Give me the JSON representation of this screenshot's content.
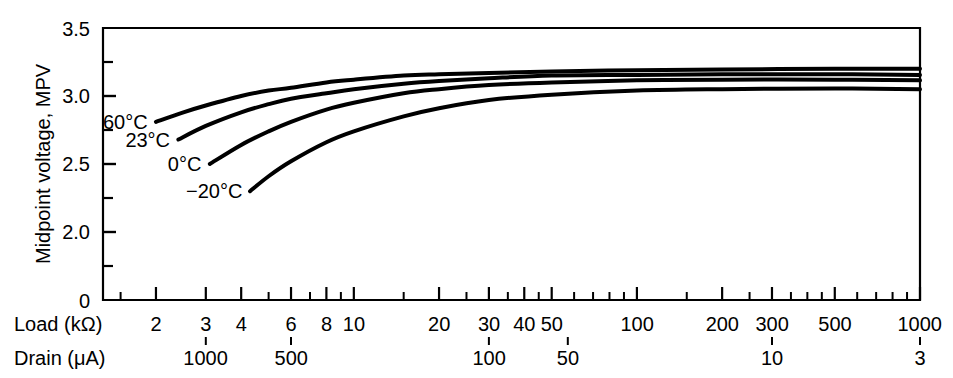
{
  "chart_data": {
    "type": "line",
    "title": "",
    "ylabel": "Midpoint voltage, MPV",
    "xlabel": "Load (kΩ)",
    "xlabel2": "Drain (μA)",
    "xscale": "log",
    "xlim": [
      1.3,
      1000
    ],
    "ylim": [
      1.5,
      3.5
    ],
    "yticks": [
      "3.5",
      "3.0",
      "2.5",
      "2.0",
      "0"
    ],
    "ytick_values": [
      3.5,
      3.0,
      2.5,
      2.0,
      1.5
    ],
    "yminor_ticks": [
      3.25,
      2.75,
      2.25,
      1.75
    ],
    "y_axis_break": true,
    "grid": false,
    "legend_position": "inline-left",
    "xticks": [
      {
        "value": 2,
        "label": "2"
      },
      {
        "value": 3,
        "label": "3"
      },
      {
        "value": 4,
        "label": "4"
      },
      {
        "value": 6,
        "label": "6"
      },
      {
        "value": 8,
        "label": "8"
      },
      {
        "value": 10,
        "label": "10"
      },
      {
        "value": 20,
        "label": "20"
      },
      {
        "value": 30,
        "label": "30"
      },
      {
        "value": 40,
        "label": "40"
      },
      {
        "value": 50,
        "label": "50"
      },
      {
        "value": 100,
        "label": "100"
      },
      {
        "value": 200,
        "label": "200"
      },
      {
        "value": 300,
        "label": "300"
      },
      {
        "value": 500,
        "label": "500"
      },
      {
        "value": 1000,
        "label": "1000"
      }
    ],
    "xminor_ticks": [
      1.5,
      5,
      7,
      9,
      15,
      25,
      35,
      45,
      60,
      70,
      80,
      90,
      150,
      250,
      350,
      400,
      450,
      600,
      700,
      800,
      900
    ],
    "drain_ticks": [
      {
        "load": 3,
        "label": "1000"
      },
      {
        "load": 6,
        "label": "500"
      },
      {
        "load": 30,
        "label": "100"
      },
      {
        "load": 57,
        "label": "50"
      },
      {
        "load": 300,
        "label": "10"
      },
      {
        "load": 1000,
        "label": "3"
      }
    ],
    "series": [
      {
        "name": "60°C",
        "label": "60°C",
        "color": "#000000",
        "points": [
          [
            2.0,
            2.81
          ],
          [
            2.5,
            2.88
          ],
          [
            3.0,
            2.93
          ],
          [
            4.0,
            3.0
          ],
          [
            5.0,
            3.04
          ],
          [
            6.0,
            3.06
          ],
          [
            8.0,
            3.1
          ],
          [
            10,
            3.12
          ],
          [
            15,
            3.15
          ],
          [
            20,
            3.16
          ],
          [
            30,
            3.17
          ],
          [
            50,
            3.18
          ],
          [
            100,
            3.19
          ],
          [
            200,
            3.195
          ],
          [
            500,
            3.2
          ],
          [
            1000,
            3.2
          ]
        ]
      },
      {
        "name": "23°C",
        "label": "23°C",
        "color": "#000000",
        "points": [
          [
            2.4,
            2.68
          ],
          [
            3.0,
            2.78
          ],
          [
            4.0,
            2.88
          ],
          [
            5.0,
            2.94
          ],
          [
            6.0,
            2.98
          ],
          [
            8.0,
            3.02
          ],
          [
            10,
            3.05
          ],
          [
            15,
            3.09
          ],
          [
            20,
            3.11
          ],
          [
            30,
            3.13
          ],
          [
            50,
            3.15
          ],
          [
            100,
            3.155
          ],
          [
            200,
            3.16
          ],
          [
            500,
            3.16
          ],
          [
            1000,
            3.155
          ]
        ]
      },
      {
        "name": "0°C",
        "label": "0°C",
        "color": "#000000",
        "points": [
          [
            3.1,
            2.5
          ],
          [
            4.0,
            2.64
          ],
          [
            5.0,
            2.74
          ],
          [
            6.0,
            2.81
          ],
          [
            8.0,
            2.9
          ],
          [
            10,
            2.95
          ],
          [
            15,
            3.02
          ],
          [
            20,
            3.05
          ],
          [
            30,
            3.08
          ],
          [
            50,
            3.1
          ],
          [
            100,
            3.115
          ],
          [
            200,
            3.12
          ],
          [
            500,
            3.12
          ],
          [
            1000,
            3.115
          ]
        ]
      },
      {
        "name": "−20°C",
        "label": "−20°C",
        "color": "#000000",
        "points": [
          [
            4.3,
            2.3
          ],
          [
            5.0,
            2.41
          ],
          [
            6.0,
            2.52
          ],
          [
            8.0,
            2.66
          ],
          [
            10,
            2.74
          ],
          [
            15,
            2.85
          ],
          [
            20,
            2.91
          ],
          [
            30,
            2.97
          ],
          [
            50,
            3.01
          ],
          [
            100,
            3.04
          ],
          [
            200,
            3.05
          ],
          [
            500,
            3.055
          ],
          [
            1000,
            3.05
          ]
        ]
      }
    ]
  }
}
